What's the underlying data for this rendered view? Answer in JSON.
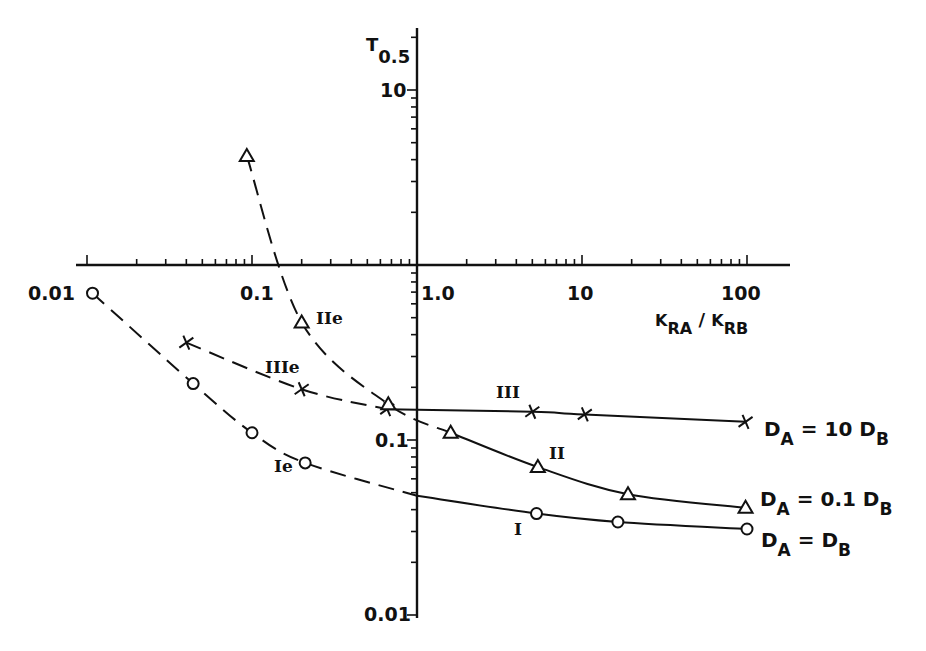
{
  "chart_data": {
    "type": "line",
    "title": "",
    "xlabel": "K_RA / K_RB",
    "ylabel": "T_0.5",
    "xscale": "log",
    "yscale": "log",
    "xlim": [
      0.01,
      150
    ],
    "ylim": [
      0.01,
      20
    ],
    "axes_cross_at": {
      "x": 1.0,
      "y": 1.0
    },
    "x_tick_labels": [
      "0.01",
      "0.1",
      "1.0",
      "10",
      "100"
    ],
    "x_ticks": [
      0.01,
      0.1,
      1,
      10,
      100
    ],
    "y_tick_labels": [
      "10",
      "0.1",
      "0.01"
    ],
    "y_ticks": [
      10,
      0.1,
      0.01
    ],
    "grid": false,
    "axis_label_parts": {
      "x": {
        "k1": "K",
        "s1": "RA",
        "sep": " / ",
        "k2": "K",
        "s2": "RB"
      },
      "y": {
        "main": "T",
        "sub": "0.5"
      }
    },
    "series": [
      {
        "name": "D_A = 10 D_B",
        "marker": "x",
        "legend": {
          "pre": "D",
          "sub1": "A",
          "mid": " = 10  D",
          "sub2": "B"
        },
        "label_solid": "III",
        "label_dashed": "IIIe",
        "dashed_points": [
          [
            0.04,
            0.36
          ],
          [
            0.2,
            0.195
          ],
          [
            0.66,
            0.15
          ]
        ],
        "solid_points": [
          [
            0.66,
            0.15
          ],
          [
            5.0,
            0.145
          ],
          [
            10.4,
            0.14
          ],
          [
            98,
            0.127
          ]
        ]
      },
      {
        "name": "D_A = 0.1 D_B",
        "marker": "triangle",
        "legend": {
          "pre": "D",
          "sub1": "A",
          "mid": " = 0.1 D",
          "sub2": "B"
        },
        "label_solid": "II",
        "label_dashed": "IIe",
        "dashed_points": [
          [
            0.093,
            4.2
          ],
          [
            0.2,
            0.47
          ],
          [
            0.67,
            0.16
          ],
          [
            1.6,
            0.11
          ]
        ],
        "solid_points": [
          [
            1.6,
            0.11
          ],
          [
            5.4,
            0.07
          ],
          [
            19,
            0.049
          ],
          [
            98,
            0.041
          ]
        ]
      },
      {
        "name": "D_A = D_B",
        "marker": "circle",
        "legend": {
          "pre": "D",
          "sub1": "A",
          "mid": " = D",
          "sub2": "B"
        },
        "label_solid": "I",
        "label_dashed": "Ie",
        "dashed_points": [
          [
            0.0108,
            0.69
          ],
          [
            0.044,
            0.21
          ],
          [
            0.1,
            0.11
          ],
          [
            0.21,
            0.074
          ],
          [
            1.0,
            0.048
          ]
        ],
        "solid_points": [
          [
            1.0,
            0.048
          ],
          [
            5.3,
            0.038
          ],
          [
            16.5,
            0.034
          ],
          [
            100,
            0.031
          ]
        ]
      }
    ]
  }
}
